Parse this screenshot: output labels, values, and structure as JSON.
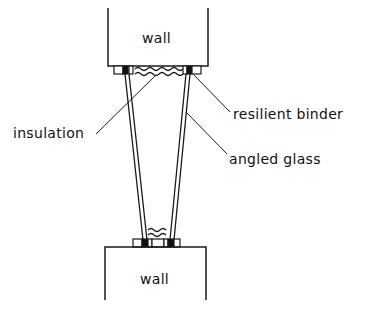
{
  "diagram": {
    "title": "",
    "labels": {
      "top_wall": "wall",
      "bottom_wall": "wall",
      "insulation": "insulation",
      "resilient_binder": "resilient binder",
      "angled_glass": "angled glass"
    },
    "colors": {
      "stroke": "#1a1a1a",
      "background": "#ffffff",
      "block_dark": "#111111"
    }
  }
}
